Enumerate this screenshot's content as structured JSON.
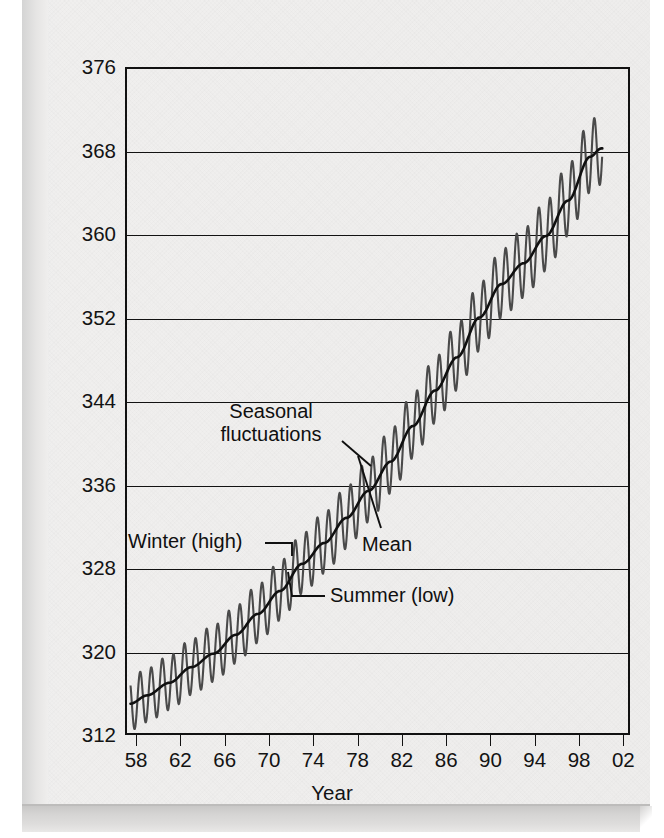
{
  "figure": {
    "background_color": "#efeeed",
    "ink_color": "#121212",
    "seasonal_curve_color": "#4a4a4a",
    "mean_curve_color": "#101010"
  },
  "annotations": {
    "seasonal_line1": "Seasonal",
    "seasonal_line2": "fluctuations",
    "winter": "Winter (high)",
    "mean": "Mean",
    "summer": "Summer (low)"
  },
  "chart_data": {
    "type": "line",
    "title": "",
    "subtitle": "",
    "xlabel": "Year",
    "ylabel": "Carbon dioxide concentration (parts per million)",
    "xlim": [
      1957.0,
      2002.6
    ],
    "ylim": [
      312,
      376
    ],
    "ytick_values": [
      312,
      320,
      328,
      336,
      344,
      352,
      360,
      368,
      376
    ],
    "ytick_labels": [
      "312",
      "320",
      "328",
      "336",
      "344",
      "352",
      "360",
      "368",
      "376"
    ],
    "xtick_values": [
      1958,
      1962,
      1966,
      1970,
      1974,
      1978,
      1982,
      1986,
      1990,
      1994,
      1998,
      2002
    ],
    "xtick_labels": [
      "58",
      "62",
      "66",
      "70",
      "74",
      "78",
      "82",
      "86",
      "90",
      "94",
      "98",
      "02"
    ],
    "grid": "horizontal",
    "legend": "none",
    "series": [
      {
        "name": "Mean",
        "description": "Smoothed annual mean CO2 concentration (Keeling curve trend)",
        "x": [
          1957.5,
          1959,
          1961,
          1963,
          1965,
          1967,
          1969,
          1971,
          1973,
          1975,
          1977,
          1979,
          1981,
          1983,
          1985,
          1987,
          1989,
          1991,
          1993,
          1995,
          1997,
          1999,
          2000
        ],
        "values": [
          315.0,
          315.8,
          317.0,
          318.5,
          319.8,
          321.6,
          323.6,
          325.8,
          328.4,
          330.4,
          332.8,
          335.4,
          338.2,
          341.6,
          345.0,
          348.2,
          352.0,
          355.2,
          357.2,
          359.8,
          363.2,
          367.4,
          368.2
        ]
      },
      {
        "name": "Seasonal fluctuations",
        "description": "Monthly CO2 oscillating about the mean; winter highs and summer lows",
        "amplitude_ppm": 3.1,
        "period_years": 1,
        "winter_peak_example": {
          "year": 1972,
          "value": 329.5
        },
        "summer_low_example": {
          "year": 1972,
          "value": 323.5
        },
        "final_peak": {
          "year": 1999.3,
          "value": 369.3
        }
      }
    ],
    "data_start_year": 1957.5,
    "data_end_year": 2000.1
  }
}
